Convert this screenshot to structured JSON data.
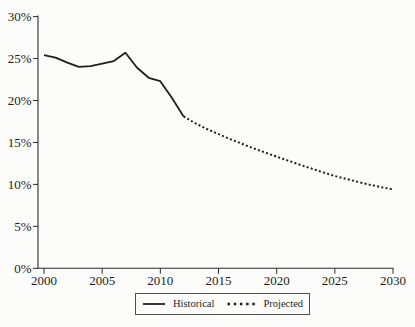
{
  "figure": {
    "background": "#fcfcfa",
    "text_color": "#1c1c1c",
    "axis_color": "#2b2b2b",
    "legend_border_color": "#4f4f4f"
  },
  "chart_data": {
    "type": "line",
    "title": "",
    "xlabel": "",
    "ylabel": "",
    "xlim": [
      2000,
      2030
    ],
    "ylim": [
      0,
      30
    ],
    "grid": false,
    "x_tick_values": [
      2000,
      2005,
      2010,
      2015,
      2020,
      2025,
      2030
    ],
    "x_tick_labels": [
      "2000",
      "2005",
      "2010",
      "2015",
      "2020",
      "2025",
      "2030"
    ],
    "y_tick_values": [
      0,
      5,
      10,
      15,
      20,
      25,
      30
    ],
    "y_tick_labels": [
      "0%",
      "5%",
      "10%",
      "15%",
      "20%",
      "25%",
      "30%"
    ],
    "legend_position": "bottom-center",
    "series": [
      {
        "name": "Historical",
        "line_style": "solid",
        "color": "#1f1f1f",
        "x": [
          2000,
          2001,
          2002,
          2003,
          2004,
          2005,
          2006,
          2007,
          2008,
          2009,
          2010,
          2011,
          2012
        ],
        "values": [
          25.4,
          25.1,
          24.5,
          24.0,
          24.1,
          24.4,
          24.7,
          25.7,
          23.9,
          22.7,
          22.3,
          20.3,
          18.1
        ]
      },
      {
        "name": "Projected",
        "line_style": "dotted",
        "color": "#1f1f1f",
        "x": [
          2012,
          2013,
          2014,
          2015,
          2016,
          2017,
          2018,
          2019,
          2020,
          2021,
          2022,
          2023,
          2024,
          2025,
          2026,
          2027,
          2028,
          2029,
          2030
        ],
        "values": [
          18.1,
          17.3,
          16.6,
          16.0,
          15.4,
          14.85,
          14.3,
          13.8,
          13.3,
          12.82,
          12.35,
          11.88,
          11.43,
          11.0,
          10.64,
          10.3,
          9.97,
          9.67,
          9.4
        ]
      }
    ]
  }
}
